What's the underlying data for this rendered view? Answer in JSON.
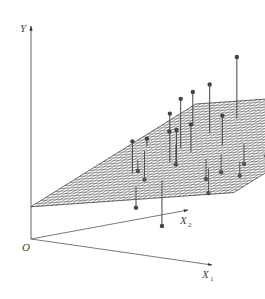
{
  "figure": {
    "title": "",
    "colors": {
      "axis": "#555555",
      "plane_hatch": "#333333",
      "point": "#444444",
      "stem": "#444444",
      "label": "#444444"
    }
  },
  "axes": {
    "y": {
      "label": "Y",
      "subscript": ""
    },
    "x1": {
      "label": "X",
      "subscript": "1"
    },
    "x2": {
      "label": "X",
      "subscript": "2"
    },
    "origin": {
      "label": "O"
    }
  },
  "chart_data": {
    "type": "scatter",
    "title": "",
    "dimensions": 3,
    "axes_labels": [
      "X1",
      "X2",
      "Y"
    ],
    "plane": {
      "description": "fitted regression plane Y = b0 + b1*X1 + b2*X2",
      "rendered_as": "hatched surface"
    },
    "points": [
      {
        "x1": 0.35,
        "x2": 0.55,
        "y": 0.62,
        "side": "above"
      },
      {
        "x1": 0.38,
        "x2": 0.7,
        "y": 0.67,
        "side": "above"
      },
      {
        "x1": 0.4,
        "x2": 0.85,
        "y": 0.78,
        "side": "above"
      },
      {
        "x1": 0.42,
        "x2": 0.4,
        "y": 0.58,
        "side": "above"
      },
      {
        "x1": 0.2,
        "x2": 0.8,
        "y": 0.6,
        "side": "above"
      },
      {
        "x1": 0.12,
        "x2": 0.6,
        "y": 0.4,
        "side": "above"
      },
      {
        "x1": 0.14,
        "x2": 0.72,
        "y": 0.42,
        "side": "above"
      },
      {
        "x1": 0.55,
        "x2": 0.9,
        "y": 0.95,
        "side": "above"
      },
      {
        "x1": 0.6,
        "x2": 0.85,
        "y": 0.88,
        "side": "above"
      },
      {
        "x1": 0.65,
        "x2": 0.8,
        "y": 0.84,
        "side": "above"
      },
      {
        "x1": 0.8,
        "x2": 0.95,
        "y": 0.92,
        "side": "above"
      },
      {
        "x1": 0.82,
        "x2": 0.96,
        "y": 0.93,
        "side": "above"
      },
      {
        "x1": 0.75,
        "x2": 0.7,
        "y": 0.8,
        "side": "above"
      },
      {
        "x1": 0.5,
        "x2": 0.35,
        "y": 0.52,
        "side": "above"
      },
      {
        "x1": 0.3,
        "x2": 0.3,
        "y": 0.45,
        "side": "above"
      },
      {
        "x1": 0.45,
        "x2": 0.5,
        "y": 0.52,
        "side": "above"
      },
      {
        "x1": 0.58,
        "x2": 0.55,
        "y": 0.57,
        "side": "above"
      },
      {
        "x1": 0.15,
        "x2": 0.55,
        "y": 0.22,
        "side": "below"
      },
      {
        "x1": 0.2,
        "x2": 0.45,
        "y": 0.28,
        "side": "below"
      },
      {
        "x1": 0.28,
        "x2": 0.6,
        "y": 0.3,
        "side": "below"
      },
      {
        "x1": 0.55,
        "x2": 0.2,
        "y": 0.1,
        "side": "below"
      },
      {
        "x1": 0.45,
        "x2": 0.15,
        "y": 0.18,
        "side": "below"
      },
      {
        "x1": 0.62,
        "x2": 0.4,
        "y": 0.3,
        "side": "below"
      },
      {
        "x1": 0.7,
        "x2": 0.55,
        "y": 0.36,
        "side": "below"
      },
      {
        "x1": 0.66,
        "x2": 0.45,
        "y": 0.33,
        "side": "below"
      },
      {
        "x1": 0.78,
        "x2": 0.6,
        "y": 0.4,
        "side": "below"
      },
      {
        "x1": 0.88,
        "x2": 0.75,
        "y": 0.48,
        "side": "below"
      },
      {
        "x1": 0.95,
        "x2": 0.85,
        "y": 0.58,
        "side": "below"
      },
      {
        "x1": 0.85,
        "x2": 0.35,
        "y": 0.35,
        "side": "below"
      },
      {
        "x1": 0.72,
        "x2": 0.3,
        "y": 0.26,
        "side": "below"
      }
    ]
  }
}
